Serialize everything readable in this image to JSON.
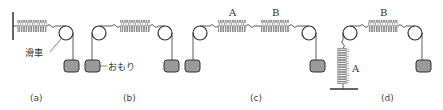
{
  "labels": {
    "pulley": "滑車",
    "weight": "おもり",
    "spring_a": "A",
    "spring_b": "B"
  },
  "captions": {
    "a": "(a)",
    "b": "(b)",
    "c": "(c)",
    "d": "(d)"
  },
  "colors": {
    "line": "#333333",
    "spring": "#666666",
    "weight_fill": "#9a9a9a",
    "background": "#ffffff"
  }
}
